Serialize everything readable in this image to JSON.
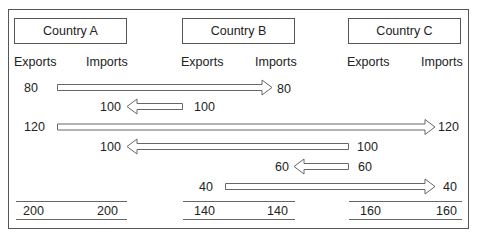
{
  "countries": [
    {
      "name": "Country A",
      "exports_label": "Exports",
      "imports_label": "Imports",
      "total_exports": "200",
      "total_imports": "200"
    },
    {
      "name": "Country B",
      "exports_label": "Exports",
      "imports_label": "Imports",
      "total_exports": "140",
      "total_imports": "140"
    },
    {
      "name": "Country C",
      "exports_label": "Exports",
      "imports_label": "Imports",
      "total_exports": "160",
      "total_imports": "160"
    }
  ],
  "flows": [
    {
      "from": "Country A",
      "to": "Country B",
      "export_value": "80",
      "import_value": "80",
      "direction": "right"
    },
    {
      "from": "Country B",
      "to": "Country A",
      "export_value": "100",
      "import_value": "100",
      "direction": "left"
    },
    {
      "from": "Country A",
      "to": "Country C",
      "export_value": "120",
      "import_value": "120",
      "direction": "right"
    },
    {
      "from": "Country C",
      "to": "Country A",
      "export_value": "100",
      "import_value": "100",
      "direction": "left"
    },
    {
      "from": "Country C",
      "to": "Country B",
      "export_value": "60",
      "import_value": "60",
      "direction": "left"
    },
    {
      "from": "Country B",
      "to": "Country C",
      "export_value": "40",
      "import_value": "40",
      "direction": "right"
    }
  ]
}
